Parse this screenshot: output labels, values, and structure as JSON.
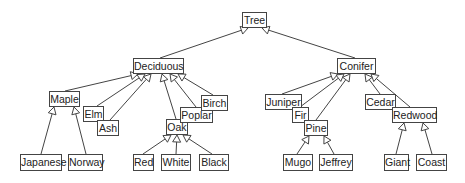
{
  "diagram": {
    "type": "class-hierarchy-tree",
    "edge_style": "hollow-triangle-arrow-to-parent",
    "colors": {
      "line": "#444444",
      "box_border": "#444444",
      "text": "#222222",
      "background": "#ffffff"
    },
    "nodes": [
      {
        "id": "tree",
        "label": "Tree",
        "x": 242,
        "y": 12,
        "w": 25,
        "h": 16
      },
      {
        "id": "deciduous",
        "label": "Deciduous",
        "x": 133,
        "y": 58,
        "w": 51,
        "h": 16
      },
      {
        "id": "conifer",
        "label": "Conifer",
        "x": 337,
        "y": 58,
        "w": 39,
        "h": 16
      },
      {
        "id": "maple",
        "label": "Maple",
        "x": 49,
        "y": 91,
        "w": 31,
        "h": 16
      },
      {
        "id": "elm",
        "label": "Elm",
        "x": 83,
        "y": 106,
        "w": 21,
        "h": 16
      },
      {
        "id": "ash",
        "label": "Ash",
        "x": 97,
        "y": 120,
        "w": 22,
        "h": 16
      },
      {
        "id": "oak",
        "label": "Oak",
        "x": 166,
        "y": 119,
        "w": 22,
        "h": 16
      },
      {
        "id": "poplar",
        "label": "Poplar",
        "x": 180,
        "y": 107,
        "w": 33,
        "h": 16
      },
      {
        "id": "birch",
        "label": "Birch",
        "x": 201,
        "y": 95,
        "w": 27,
        "h": 16
      },
      {
        "id": "japanese",
        "label": "Japanese",
        "x": 20,
        "y": 154,
        "w": 42,
        "h": 17
      },
      {
        "id": "norway",
        "label": "Norway",
        "x": 68,
        "y": 154,
        "w": 35,
        "h": 17
      },
      {
        "id": "red",
        "label": "Red",
        "x": 133,
        "y": 154,
        "w": 21,
        "h": 17
      },
      {
        "id": "white",
        "label": "White",
        "x": 161,
        "y": 154,
        "w": 30,
        "h": 17
      },
      {
        "id": "black",
        "label": "Black",
        "x": 199,
        "y": 154,
        "w": 30,
        "h": 17
      },
      {
        "id": "juniper",
        "label": "Juniper",
        "x": 265,
        "y": 94,
        "w": 37,
        "h": 16
      },
      {
        "id": "fir",
        "label": "Fir",
        "x": 292,
        "y": 107,
        "w": 17,
        "h": 16
      },
      {
        "id": "pine",
        "label": "Pine",
        "x": 304,
        "y": 120,
        "w": 24,
        "h": 16
      },
      {
        "id": "cedar",
        "label": "Cedar",
        "x": 365,
        "y": 94,
        "w": 31,
        "h": 16
      },
      {
        "id": "redwood",
        "label": "Redwood",
        "x": 392,
        "y": 107,
        "w": 45,
        "h": 16
      },
      {
        "id": "mugo",
        "label": "Mugo",
        "x": 283,
        "y": 154,
        "w": 30,
        "h": 17
      },
      {
        "id": "jeffrey",
        "label": "Jeffrey",
        "x": 319,
        "y": 154,
        "w": 34,
        "h": 17
      },
      {
        "id": "giant",
        "label": "Giant",
        "x": 384,
        "y": 154,
        "w": 25,
        "h": 17
      },
      {
        "id": "coast",
        "label": "Coast",
        "x": 416,
        "y": 154,
        "w": 31,
        "h": 17
      }
    ],
    "edges": [
      {
        "from": "deciduous",
        "to": "tree",
        "x1": 160,
        "y1": 58,
        "x2": 248,
        "y2": 28
      },
      {
        "from": "conifer",
        "to": "tree",
        "x1": 355,
        "y1": 58,
        "x2": 262,
        "y2": 28
      },
      {
        "from": "maple",
        "to": "deciduous",
        "x1": 65,
        "y1": 91,
        "x2": 138,
        "y2": 74
      },
      {
        "from": "elm",
        "to": "deciduous",
        "x1": 97,
        "y1": 106,
        "x2": 145,
        "y2": 74
      },
      {
        "from": "ash",
        "to": "deciduous",
        "x1": 110,
        "y1": 120,
        "x2": 151,
        "y2": 74
      },
      {
        "from": "oak",
        "to": "deciduous",
        "x1": 176,
        "y1": 119,
        "x2": 162,
        "y2": 74
      },
      {
        "from": "poplar",
        "to": "deciduous",
        "x1": 196,
        "y1": 107,
        "x2": 170,
        "y2": 74
      },
      {
        "from": "birch",
        "to": "deciduous",
        "x1": 213,
        "y1": 95,
        "x2": 178,
        "y2": 74
      },
      {
        "from": "japanese",
        "to": "maple",
        "x1": 41,
        "y1": 154,
        "x2": 54,
        "y2": 107
      },
      {
        "from": "norway",
        "to": "maple",
        "x1": 86,
        "y1": 154,
        "x2": 74,
        "y2": 107
      },
      {
        "from": "red",
        "to": "oak",
        "x1": 143,
        "y1": 154,
        "x2": 171,
        "y2": 135
      },
      {
        "from": "white",
        "to": "oak",
        "x1": 176,
        "y1": 154,
        "x2": 177,
        "y2": 135
      },
      {
        "from": "black",
        "to": "oak",
        "x1": 212,
        "y1": 154,
        "x2": 183,
        "y2": 135
      },
      {
        "from": "juniper",
        "to": "conifer",
        "x1": 282,
        "y1": 94,
        "x2": 338,
        "y2": 74
      },
      {
        "from": "fir",
        "to": "conifer",
        "x1": 300,
        "y1": 107,
        "x2": 344,
        "y2": 74
      },
      {
        "from": "pine",
        "to": "conifer",
        "x1": 316,
        "y1": 120,
        "x2": 350,
        "y2": 74
      },
      {
        "from": "cedar",
        "to": "conifer",
        "x1": 380,
        "y1": 94,
        "x2": 365,
        "y2": 74
      },
      {
        "from": "redwood",
        "to": "conifer",
        "x1": 410,
        "y1": 107,
        "x2": 371,
        "y2": 74
      },
      {
        "from": "mugo",
        "to": "pine",
        "x1": 297,
        "y1": 154,
        "x2": 309,
        "y2": 136
      },
      {
        "from": "jeffrey",
        "to": "pine",
        "x1": 334,
        "y1": 154,
        "x2": 324,
        "y2": 136
      },
      {
        "from": "giant",
        "to": "redwood",
        "x1": 396,
        "y1": 154,
        "x2": 404,
        "y2": 123
      },
      {
        "from": "coast",
        "to": "redwood",
        "x1": 432,
        "y1": 154,
        "x2": 423,
        "y2": 123
      }
    ]
  }
}
